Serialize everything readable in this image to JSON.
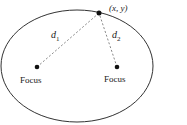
{
  "diagram": {
    "point_label": "(x, y)",
    "distance_labels": [
      {
        "base": "d",
        "sub": "1"
      },
      {
        "base": "d",
        "sub": "2"
      }
    ],
    "foci": [
      {
        "label": "Focus"
      },
      {
        "label": "Focus"
      }
    ],
    "colors": {
      "stroke": "#333333",
      "dash": "#888888",
      "text": "#222222"
    }
  }
}
